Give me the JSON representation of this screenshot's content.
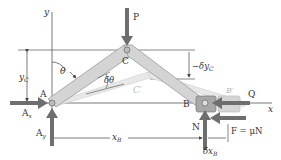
{
  "diagram": {
    "type": "mechanics-virtual-work",
    "colors": {
      "member": "#d4d4d4",
      "member_edge": "#9a9a9a",
      "force_arrow": "#6e6e6e",
      "line": "#444444",
      "ghost": "#c8c8c8",
      "block": "#a8a8a8",
      "ghost_block": "#cfcfcf",
      "background": "#ffffff"
    },
    "axes": {
      "x_label": "x",
      "y_label": "y"
    },
    "points": {
      "A": "A",
      "B": "B",
      "C": "C",
      "B_prime": "B′",
      "C_prime": "C′"
    },
    "forces": {
      "P": "P",
      "Q": "Q",
      "Ax": "A",
      "Ax_sub": "x",
      "Ay": "A",
      "Ay_sub": "y",
      "N": "N",
      "F": "F = μN"
    },
    "dimensions": {
      "yC": "y",
      "yC_sub": "C",
      "neg_delta_yC": "−δy",
      "neg_delta_yC_sub": "C",
      "xB": "x",
      "xB_sub": "B",
      "delta_xB": "δx",
      "delta_xB_sub": "B"
    },
    "angles": {
      "theta": "θ",
      "delta_theta": "δθ"
    }
  }
}
